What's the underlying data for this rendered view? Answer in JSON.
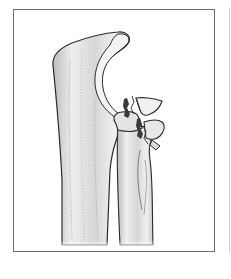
{
  "figure": {
    "parts": [
      "ulna",
      "olecranon",
      "trochlear-notch",
      "radius",
      "radial-head-fragment",
      "fracture-line"
    ],
    "colors": {
      "frame": "#6e6e6e",
      "outline": "#2a2a2a",
      "bone_fill": "#e6e6e6",
      "bone_shade": "#9a9a9a",
      "articular_surface": "#f2f2f2",
      "fracture_gap": "#3a3a3a"
    }
  }
}
